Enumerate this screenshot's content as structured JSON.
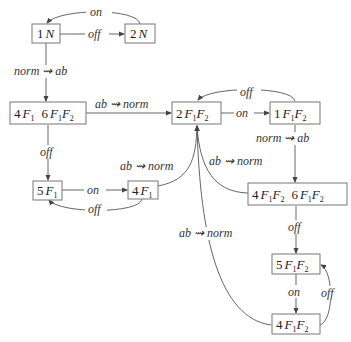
{
  "diagram": {
    "type": "state-transition",
    "nodes": {
      "n1N": {
        "num": "1",
        "sym": "N"
      },
      "n2N": {
        "num": "2",
        "sym": "N"
      },
      "n4F1_6F1F2": {
        "a_num": "4",
        "a_sym": "F",
        "a_sub": "1",
        "b_num": "6",
        "b_sym1": "F",
        "b_sub1": "1",
        "b_sym2": "F",
        "b_sub2": "2"
      },
      "n2F1F2": {
        "num": "2",
        "sym1": "F",
        "sub1": "1",
        "sym2": "F",
        "sub2": "2"
      },
      "n1F1F2": {
        "num": "1",
        "sym1": "F",
        "sub1": "1",
        "sym2": "F",
        "sub2": "2"
      },
      "n5F1": {
        "num": "5",
        "sym": "F",
        "sub": "1"
      },
      "n4F1": {
        "num": "4",
        "sym": "F",
        "sub": "1"
      },
      "n4F1F2_6F1F2": {
        "a_num": "4",
        "a_sym1": "F",
        "a_sub1": "1",
        "a_sym2": "F",
        "a_sub2": "2",
        "b_num": "6",
        "b_sym1": "F",
        "b_sub1": "1",
        "b_sym2": "F",
        "b_sub2": "2"
      },
      "n5F1F2": {
        "num": "5",
        "sym1": "F",
        "sub1": "1",
        "sym2": "F",
        "sub2": "2"
      },
      "n4F1F2": {
        "num": "4",
        "sym1": "F",
        "sub1": "1",
        "sym2": "F",
        "sub2": "2"
      }
    },
    "edges": {
      "e_2N_1N": "on",
      "e_1N_2N": "off",
      "e_1N_4F1": "norm ⇝ ab",
      "e_4F1_2F1F2": "ab ⇝ norm",
      "e_1F1F2_2F1F2": "off",
      "e_2F1F2_1F1F2": "on",
      "e_1F1F2_4F1F2": "norm ⇝ ab",
      "e_4F1_5F1": "off",
      "e_4F1b_2F1F2": "ab ⇝ norm",
      "e_4F1F2_2F1F2": "ab ⇝ norm",
      "e_5F1_4F1": "on",
      "e_4F1_5F1b": "off",
      "e_4F1F2_5F1F2": "off",
      "e_5F1F2_4F1F2": "on",
      "e_4F1F2b_5F1F2": "off",
      "e_bottom_2F1F2": "ab ⇝ norm"
    }
  }
}
